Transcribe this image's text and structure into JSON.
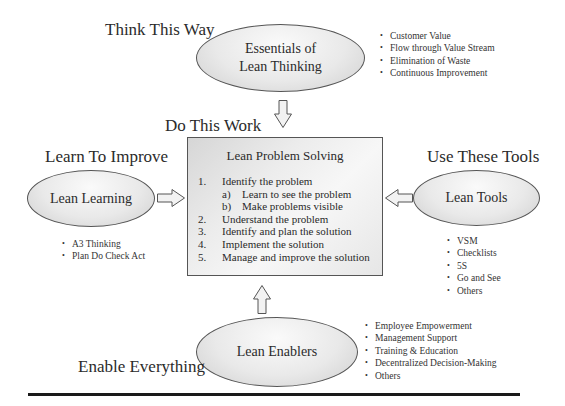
{
  "top": {
    "heading": "Think This Way",
    "node_label_line1": "Essentials of",
    "node_label_line2": "Lean Thinking",
    "bullets": [
      "Customer Value",
      "Flow through Value Stream",
      "Elimination of Waste",
      "Continuous Improvement"
    ]
  },
  "center": {
    "heading": "Do This Work",
    "title": "Lean Problem Solving",
    "steps": [
      {
        "num": "1.",
        "text": "Identify the problem"
      },
      {
        "num": "a)",
        "text": "Learn to see the problem"
      },
      {
        "num": "b)",
        "text": "Make problems visible"
      },
      {
        "num": "2.",
        "text": "Understand the problem"
      },
      {
        "num": "3.",
        "text": "Identify and plan the solution"
      },
      {
        "num": "4.",
        "text": "Implement the solution"
      },
      {
        "num": "5.",
        "text": "Manage and improve the solution"
      }
    ]
  },
  "left": {
    "heading": "Learn To Improve",
    "node_label": "Lean Learning",
    "bullets": [
      "A3 Thinking",
      "Plan Do Check Act"
    ]
  },
  "right": {
    "heading": "Use These Tools",
    "node_label": "Lean Tools",
    "bullets": [
      "VSM",
      "Checklists",
      "5S",
      "Go and See",
      "Others"
    ]
  },
  "bottom": {
    "heading": "Enable Everything",
    "node_label": "Lean Enablers",
    "bullets": [
      "Employee Empowerment",
      "Management Support",
      "Training & Education",
      "Decentralized Decision-Making",
      "Others"
    ]
  },
  "colors": {
    "stroke": "#555555",
    "fill_light": "#fafafa",
    "fill_dark": "#cfcfcf",
    "rule": "#1a1a1a"
  }
}
